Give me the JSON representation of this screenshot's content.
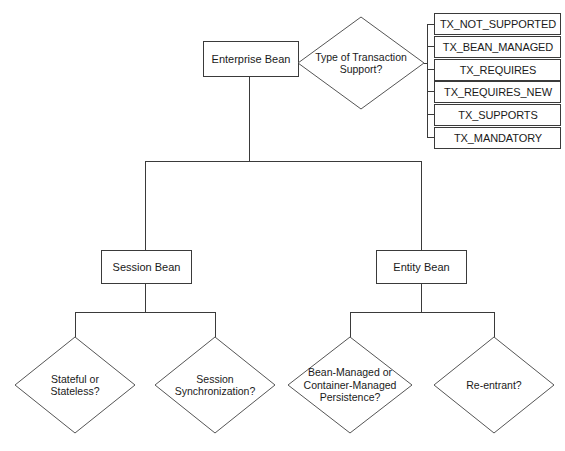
{
  "diagram": {
    "caption": "",
    "colors": {
      "background": "#ffffff",
      "stroke": "#3a3a3a",
      "diamond_stroke": "#555555",
      "text": "#1a1a1a"
    },
    "root_box": {
      "label": "Enterprise Bean"
    },
    "transaction_decision": {
      "label": "Type of Transaction\nSupport?"
    },
    "transaction_options": [
      {
        "label": "TX_NOT_SUPPORTED"
      },
      {
        "label": "TX_BEAN_MANAGED"
      },
      {
        "label": "TX_REQUIRES"
      },
      {
        "label": "TX_REQUIRES_NEW"
      },
      {
        "label": "TX_SUPPORTS"
      },
      {
        "label": "TX_MANDATORY"
      }
    ],
    "bean_types": [
      {
        "label": "Session Bean"
      },
      {
        "label": "Entity Bean"
      }
    ],
    "session_questions": [
      {
        "label": "Stateful or\nStateless?"
      },
      {
        "label": "Session\nSynchronization?"
      }
    ],
    "entity_questions": [
      {
        "label": "Bean-Managed or\nContainer-Managed\nPersistence?"
      },
      {
        "label": "Re-entrant?"
      }
    ]
  }
}
